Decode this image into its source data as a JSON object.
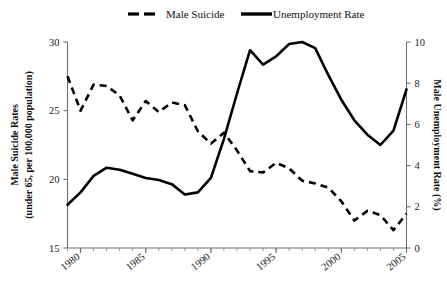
{
  "chart_data": {
    "type": "line",
    "title": "",
    "xlabel": "",
    "ylabel": "Male Suicide Rates (under 65, per 100,000 population)",
    "y2label": "Male Unemployment Rate (%)",
    "xlim": [
      1979,
      2005
    ],
    "ylim": [
      15,
      30
    ],
    "y2lim": [
      0,
      10
    ],
    "grid": false,
    "legend_position": "top",
    "x_ticks": [
      1980,
      1985,
      1990,
      1995,
      2000,
      2005
    ],
    "x_minor_ticks": [
      1979,
      1980,
      1981,
      1982,
      1983,
      1984,
      1985,
      1986,
      1987,
      1988,
      1989,
      1990,
      1991,
      1992,
      1993,
      1994,
      1995,
      1996,
      1997,
      1998,
      1999,
      2000,
      2001,
      2002,
      2003,
      2004,
      2005
    ],
    "y_ticks": [
      15,
      20,
      25,
      30
    ],
    "y2_ticks": [
      0,
      2,
      4,
      6,
      8,
      10
    ],
    "series": [
      {
        "name": "Male Suicide",
        "axis": "left",
        "style": "dashed",
        "color": "#000000",
        "x": [
          1979,
          1980,
          1981,
          1982,
          1983,
          1984,
          1985,
          1986,
          1987,
          1988,
          1989,
          1990,
          1991,
          1992,
          1993,
          1994,
          1995,
          1996,
          1997,
          1998,
          1999,
          2000,
          2001,
          2002,
          2003,
          2004,
          2005
        ],
        "values": [
          27.5,
          25.0,
          26.9,
          26.8,
          26.1,
          24.3,
          25.7,
          24.9,
          25.6,
          25.4,
          23.5,
          22.6,
          23.4,
          22.1,
          20.6,
          20.5,
          21.2,
          20.8,
          19.9,
          19.7,
          19.4,
          18.4,
          17.0,
          17.7,
          17.4,
          16.3,
          17.5
        ]
      },
      {
        "name": "Unemployment Rate",
        "axis": "right",
        "style": "solid",
        "color": "#000000",
        "x": [
          1979,
          1980,
          1981,
          1982,
          1983,
          1984,
          1985,
          1986,
          1987,
          1988,
          1989,
          1990,
          1991,
          1992,
          1993,
          1994,
          1995,
          1996,
          1997,
          1998,
          1999,
          2000,
          2001,
          2002,
          2003,
          2004,
          2005
        ],
        "values": [
          2.1,
          2.7,
          3.5,
          3.9,
          3.8,
          3.6,
          3.4,
          3.3,
          3.1,
          2.6,
          2.7,
          3.4,
          5.3,
          7.5,
          9.6,
          8.9,
          9.3,
          9.9,
          10.0,
          9.7,
          8.4,
          7.2,
          6.2,
          5.5,
          5.0,
          5.7,
          7.7
        ]
      }
    ],
    "legend": [
      {
        "label": "Male Suicide",
        "style": "dashed"
      },
      {
        "label": "Unemployment Rate",
        "style": "solid"
      }
    ]
  },
  "axes": {
    "left_title_line1": "Male Suicide Rates",
    "left_title_line2": "(under 65, per 100,000 population)",
    "right_title": "Male Unemployment Rate (%)"
  }
}
